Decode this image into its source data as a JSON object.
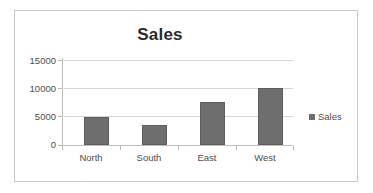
{
  "chart_data": {
    "type": "bar",
    "title": "Sales",
    "categories": [
      "North",
      "South",
      "East",
      "West"
    ],
    "values": [
      5000,
      3500,
      7500,
      10000
    ],
    "series": [
      {
        "name": "Sales",
        "values": [
          5000,
          3500,
          7500,
          10000
        ]
      }
    ],
    "xlabel": "",
    "ylabel": "",
    "ylim": [
      0,
      15000
    ],
    "ytick_labels": [
      "0",
      "5000",
      "10000",
      "15000"
    ],
    "ytick_values": [
      0,
      5000,
      10000,
      15000
    ],
    "grid": true,
    "legend": {
      "position": "right",
      "entries": [
        "Sales"
      ]
    },
    "colors": {
      "bar_fill": "#6e6e6e",
      "bar_border": "#5d5d5d",
      "gridline": "#d6d6d6",
      "axis": "#b9b9b9",
      "title_text": "#2b2b2b",
      "tick_text": "#4d4d4d",
      "frame_border": "#c9c9c9",
      "background": "#ffffff"
    }
  }
}
